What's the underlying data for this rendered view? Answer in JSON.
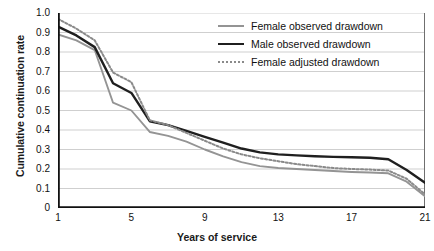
{
  "chart_data": {
    "type": "line",
    "title": "",
    "xlabel": "Years of service",
    "ylabel": "Cumulative continuation rate",
    "xlim": [
      1,
      21
    ],
    "ylim": [
      0,
      1.0
    ],
    "grid": "horizontal",
    "legend_position": "top-right",
    "x": [
      1,
      2,
      3,
      4,
      5,
      6,
      7,
      8,
      9,
      10,
      11,
      12,
      13,
      14,
      15,
      16,
      17,
      18,
      19,
      20,
      21
    ],
    "xticks": [
      1,
      5,
      9,
      13,
      17,
      21
    ],
    "xtick_labels": [
      "1",
      "5",
      "9",
      "13",
      "17",
      "21"
    ],
    "yticks": [
      0,
      0.1,
      0.2,
      0.3,
      0.4,
      0.5,
      0.6,
      0.7,
      0.8,
      0.9,
      1.0
    ],
    "ytick_labels": [
      "0",
      "0.1",
      "0.2",
      "0.3",
      "0.4",
      "0.5",
      "0.6",
      "0.7",
      "0.8",
      "0.9",
      "1.0"
    ],
    "series": [
      {
        "name": "Female observed drawdown",
        "color": "#949494",
        "style": "solid",
        "values": [
          0.89,
          0.86,
          0.81,
          0.54,
          0.5,
          0.39,
          0.37,
          0.34,
          0.3,
          0.265,
          0.235,
          0.215,
          0.205,
          0.2,
          0.195,
          0.19,
          0.185,
          0.182,
          0.178,
          0.135,
          0.06
        ]
      },
      {
        "name": "Male observed drawdown",
        "color": "#1f1f1f",
        "style": "solid",
        "values": [
          0.93,
          0.885,
          0.825,
          0.64,
          0.59,
          0.445,
          0.425,
          0.395,
          0.365,
          0.335,
          0.305,
          0.285,
          0.275,
          0.27,
          0.265,
          0.262,
          0.26,
          0.258,
          0.25,
          0.195,
          0.13
        ]
      },
      {
        "name": "Female adjusted drawdown",
        "color": "#8a8a8a",
        "style": "dotted",
        "values": [
          0.97,
          0.92,
          0.86,
          0.695,
          0.645,
          0.45,
          0.425,
          0.385,
          0.345,
          0.305,
          0.275,
          0.255,
          0.24,
          0.225,
          0.215,
          0.205,
          0.2,
          0.197,
          0.192,
          0.15,
          0.07
        ]
      }
    ]
  },
  "axes": {
    "y_title": "Cumulative continuation rate",
    "x_title": "Years of service"
  },
  "legend": {
    "items": [
      {
        "label": "Female observed drawdown",
        "swatch": "line-solid-gray-icon"
      },
      {
        "label": "Male observed drawdown",
        "swatch": "line-solid-black-icon"
      },
      {
        "label": "Female adjusted drawdown",
        "swatch": "line-dotted-gray-icon"
      }
    ]
  },
  "colors": {
    "female_observed": "#949494",
    "male_observed": "#1f1f1f",
    "female_adjusted": "#8a8a8a",
    "grid": "#c9c9c9",
    "axis": "#111111"
  }
}
